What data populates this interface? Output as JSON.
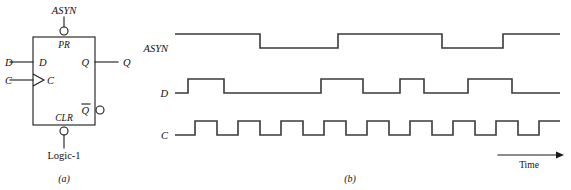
{
  "figure": {
    "background_color": "#ffffff",
    "line_color": "#1a1a1a",
    "wave_color": "#3a3a3a",
    "width": 571,
    "height": 190
  },
  "panel_a": {
    "caption": "(a)",
    "description": "Edge-triggered D flip-flop symbol",
    "block": {
      "x": 33,
      "y": 37,
      "width": 62,
      "height": 88
    },
    "pins": {
      "preset_label": "PR",
      "clear_label": "CLR",
      "d_internal_label": "D",
      "c_internal_label": "C",
      "q_internal_label": "Q",
      "qbar_internal_label": "Q"
    },
    "external_labels": {
      "asyn": "ASYN",
      "d_input": "D",
      "c_input": "C",
      "q_output": "Q",
      "logic_one": "Logic-1"
    },
    "bubbles": [
      {
        "name": "preset-bubble",
        "cx": 64,
        "cy": 31,
        "r": 4
      },
      {
        "name": "clear-bubble",
        "cx": 64,
        "cy": 131,
        "r": 4
      },
      {
        "name": "qbar-bubble",
        "cx": 100,
        "cy": 110,
        "r": 4
      }
    ],
    "clock_triangle": {
      "x": 33,
      "y": 74,
      "width": 11,
      "height": 12
    }
  },
  "panel_b": {
    "caption": "(b)",
    "time_axis_label": "Time",
    "signals": [
      {
        "name": "ASYN",
        "label": "ASYN"
      },
      {
        "name": "D",
        "label": "D"
      },
      {
        "name": "C",
        "label": "C"
      }
    ]
  },
  "chart_data": {
    "type": "line",
    "xlabel": "Time",
    "ylabel": "",
    "grid": false,
    "legend": "none",
    "x_start": 175,
    "x_end": 560,
    "waveform_geometry": {
      "high_offset_px": -14,
      "low_offset_px": 0
    },
    "series": [
      {
        "name": "ASYN",
        "label": "ASYN",
        "baseline_y": 48,
        "initial_level": 1,
        "transitions": [
          {
            "x": 260,
            "level": 0
          },
          {
            "x": 338,
            "level": 1
          },
          {
            "x": 442,
            "level": 0
          },
          {
            "x": 503,
            "level": 1
          }
        ],
        "levels_sequence": [
          1,
          0,
          1,
          0,
          1
        ]
      },
      {
        "name": "D",
        "label": "D",
        "baseline_y": 93,
        "initial_level": 0,
        "transitions": [
          {
            "x": 188,
            "level": 1
          },
          {
            "x": 224,
            "level": 0
          },
          {
            "x": 321,
            "level": 1
          },
          {
            "x": 363,
            "level": 0
          },
          {
            "x": 400,
            "level": 1
          },
          {
            "x": 424,
            "level": 0
          },
          {
            "x": 468,
            "level": 1
          },
          {
            "x": 512,
            "level": 0
          }
        ],
        "levels_sequence": [
          0,
          1,
          0,
          1,
          0,
          1,
          0,
          1,
          0
        ]
      },
      {
        "name": "C",
        "label": "C",
        "baseline_y": 135,
        "initial_level": 0,
        "period_px": 43,
        "pulse_width_px": 22,
        "first_rise_x": 195,
        "pulse_count": 9,
        "transitions": [
          {
            "x": 195,
            "level": 1
          },
          {
            "x": 217,
            "level": 0
          },
          {
            "x": 238,
            "level": 1
          },
          {
            "x": 260,
            "level": 0
          },
          {
            "x": 281,
            "level": 1
          },
          {
            "x": 303,
            "level": 0
          },
          {
            "x": 324,
            "level": 1
          },
          {
            "x": 346,
            "level": 0
          },
          {
            "x": 367,
            "level": 1
          },
          {
            "x": 389,
            "level": 0
          },
          {
            "x": 410,
            "level": 1
          },
          {
            "x": 432,
            "level": 0
          },
          {
            "x": 453,
            "level": 1
          },
          {
            "x": 475,
            "level": 0
          },
          {
            "x": 496,
            "level": 1
          },
          {
            "x": 518,
            "level": 0
          },
          {
            "x": 539,
            "level": 1
          },
          {
            "x": 561,
            "level": 0
          }
        ]
      }
    ],
    "time_arrow": {
      "x1": 498,
      "x2": 560,
      "y": 155
    }
  }
}
